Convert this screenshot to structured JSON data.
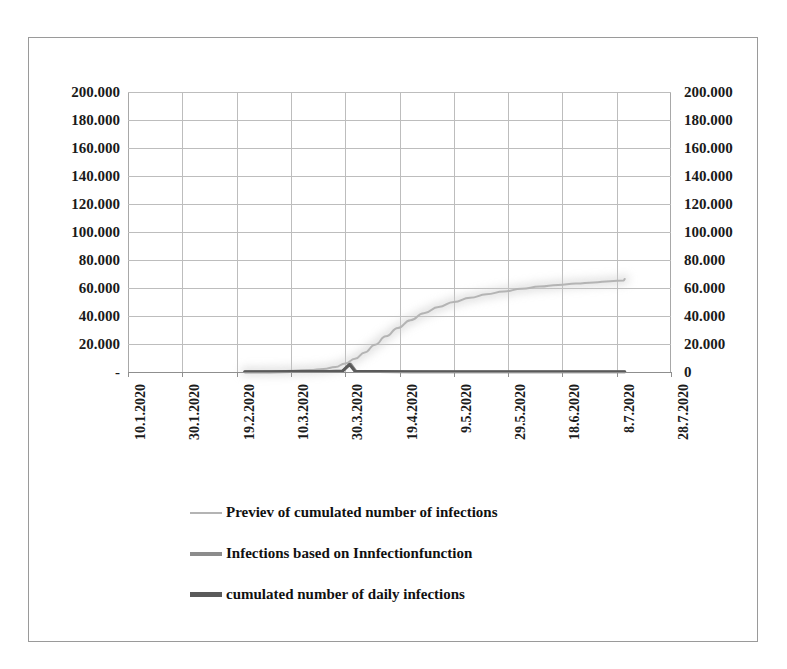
{
  "chart_data": {
    "type": "line",
    "title": "",
    "subtitle": "",
    "xlabel": "",
    "ylabel": "",
    "ylim": [
      0,
      200000
    ],
    "grid": true,
    "legend_position": "bottom",
    "y_axis_left": {
      "ticks": [
        "200.000",
        "180.000",
        "160.000",
        "140.000",
        "120.000",
        "100.000",
        "80.000",
        "60.000",
        "40.000",
        "20.000",
        "-"
      ],
      "values": [
        200000,
        180000,
        160000,
        140000,
        120000,
        100000,
        80000,
        60000,
        40000,
        20000,
        0
      ]
    },
    "y_axis_right": {
      "ticks": [
        "200.000",
        "180.000",
        "160.000",
        "140.000",
        "120.000",
        "100.000",
        "80.000",
        "60.000",
        "40.000",
        "20.000",
        "0"
      ],
      "values": [
        200000,
        180000,
        160000,
        140000,
        120000,
        100000,
        80000,
        60000,
        40000,
        20000,
        0
      ]
    },
    "categories": [
      "10.1.2020",
      "30.1.2020",
      "19.2.2020",
      "10.3.2020",
      "30.3.2020",
      "19.4.2020",
      "9.5.2020",
      "29.5.2020",
      "18.6.2020",
      "8.7.2020",
      "28.7.2020"
    ],
    "x_tick_rotation": -90,
    "series": [
      {
        "name": "Previev of cumulated number of infections",
        "color": "#b4b4b4",
        "width": 2.0,
        "x_start_date": "30.1.2020",
        "x_end_date": "8.7.2020",
        "points": [
          [
            0.215,
            300
          ],
          [
            0.245,
            400
          ],
          [
            0.275,
            600
          ],
          [
            0.305,
            900
          ],
          [
            0.335,
            1400
          ],
          [
            0.36,
            2200
          ],
          [
            0.382,
            3600
          ],
          [
            0.4,
            6000
          ],
          [
            0.418,
            9500
          ],
          [
            0.436,
            14000
          ],
          [
            0.455,
            19500
          ],
          [
            0.475,
            25500
          ],
          [
            0.497,
            31500
          ],
          [
            0.52,
            37000
          ],
          [
            0.545,
            42000
          ],
          [
            0.572,
            46500
          ],
          [
            0.6,
            50000
          ],
          [
            0.63,
            53000
          ],
          [
            0.66,
            55500
          ],
          [
            0.692,
            57500
          ],
          [
            0.725,
            59500
          ],
          [
            0.758,
            61000
          ],
          [
            0.792,
            62200
          ],
          [
            0.825,
            63200
          ],
          [
            0.858,
            64000
          ],
          [
            0.888,
            64800
          ],
          [
            0.913,
            65400
          ],
          [
            0.915,
            66500
          ]
        ]
      },
      {
        "name": "Infections based on Innfectionfunction",
        "color": "#8c8c8c",
        "width": 2.6,
        "x_start_date": "30.1.2020",
        "x_end_date": "8.7.2020",
        "points": [
          [
            0.215,
            200
          ],
          [
            0.26,
            250
          ],
          [
            0.3,
            300
          ],
          [
            0.34,
            400
          ],
          [
            0.37,
            500
          ],
          [
            0.395,
            700
          ],
          [
            0.41,
            5800
          ],
          [
            0.42,
            500
          ],
          [
            0.46,
            300
          ],
          [
            0.52,
            250
          ],
          [
            0.6,
            200
          ],
          [
            0.7,
            200
          ],
          [
            0.8,
            200
          ],
          [
            0.9,
            200
          ],
          [
            0.915,
            200
          ]
        ]
      },
      {
        "name": "cumulated number of daily infections",
        "color": "#5a5a5a",
        "width": 3.0,
        "x_start_date": "30.1.2020",
        "x_end_date": "8.7.2020",
        "points": [
          [
            0.215,
            150
          ],
          [
            0.26,
            200
          ],
          [
            0.3,
            250
          ],
          [
            0.34,
            350
          ],
          [
            0.37,
            450
          ],
          [
            0.395,
            650
          ],
          [
            0.408,
            5500
          ],
          [
            0.418,
            450
          ],
          [
            0.46,
            250
          ],
          [
            0.52,
            200
          ],
          [
            0.6,
            180
          ],
          [
            0.7,
            180
          ],
          [
            0.8,
            180
          ],
          [
            0.9,
            180
          ],
          [
            0.915,
            180
          ]
        ]
      }
    ],
    "legend": [
      {
        "label": "Previev of cumulated number of infections",
        "color": "#b4b4b4",
        "thickness": 2
      },
      {
        "label": "Infections based on Innfectionfunction",
        "color": "#8c8c8c",
        "thickness": 4
      },
      {
        "label": "cumulated number of daily infections",
        "color": "#5a5a5a",
        "thickness": 5
      }
    ],
    "colors": {
      "grid": "#bdbdbd",
      "axis": "#8f8f8f",
      "frame": "#9a9a9a",
      "text": "#1a1a1a",
      "background": "#ffffff"
    }
  }
}
